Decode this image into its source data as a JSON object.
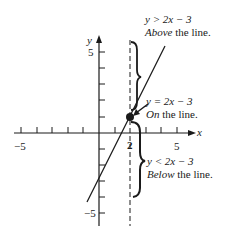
{
  "diagram": {
    "axes": {
      "x_label": "x",
      "y_label": "y",
      "x_ticks": [
        -5,
        -4,
        -3,
        -2,
        -1,
        0,
        1,
        2,
        3,
        4,
        5
      ],
      "y_ticks": [
        -5,
        -4,
        -3,
        -2,
        -1,
        0,
        1,
        2,
        3,
        4,
        5
      ],
      "x_tick_labels": {
        "neg5": "−5",
        "two": "2",
        "five": "5"
      },
      "y_tick_labels": {
        "five": "5",
        "neg5": "−5"
      }
    },
    "line": {
      "equation": "y = 2x − 3",
      "slope": 2,
      "intercept": -3
    },
    "point": {
      "x": 2,
      "y": 1
    },
    "vertical_guide": {
      "x": 2,
      "style": "dashed"
    },
    "annotations": {
      "above": {
        "inequality": "y > 2x − 3",
        "desc_em": "Above",
        "desc_rest": " the line."
      },
      "on": {
        "equation": "y = 2x − 3",
        "desc_em": "On",
        "desc_rest": " the line."
      },
      "below": {
        "inequality": "y < 2x − 3",
        "desc_em": "Below",
        "desc_rest": " the line."
      }
    },
    "colors": {
      "ink": "#1a1a1a",
      "background": "#ffffff"
    }
  }
}
